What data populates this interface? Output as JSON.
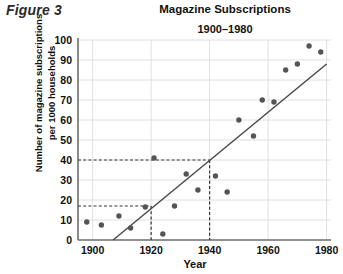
{
  "figure": {
    "label": "Figure 3"
  },
  "chart_data": {
    "type": "scatter",
    "title": "Magazine Subscriptions",
    "subtitle": "1900–1980",
    "xlabel": "Year",
    "ylabel_line1": "Number of magazine subscriptions",
    "ylabel_line2": "per 1000 households",
    "xlim": [
      1895,
      1980
    ],
    "ylim": [
      0,
      100
    ],
    "xticks": [
      1900,
      1920,
      1940,
      1960,
      1980
    ],
    "yticks": [
      0,
      10,
      20,
      30,
      40,
      50,
      60,
      70,
      80,
      90,
      100
    ],
    "grid": true,
    "legend": "none",
    "point_color": "#555555",
    "line_color": "#4a4a4a",
    "guide_color": "#333333",
    "grid_color": "#d8d8d8",
    "axis_color": "#777777",
    "x": [
      1898,
      1903,
      1909,
      1913,
      1918,
      1921,
      1924,
      1928,
      1932,
      1936,
      1942,
      1946,
      1950,
      1955,
      1958,
      1962,
      1966,
      1970,
      1974,
      1978
    ],
    "y": [
      9,
      7.5,
      12,
      6,
      16.5,
      41,
      3,
      17,
      33,
      25,
      32,
      24,
      60,
      52,
      70,
      69,
      85,
      88,
      97,
      94
    ],
    "points": [
      {
        "x": 1898,
        "y": 9
      },
      {
        "x": 1903,
        "y": 7.5
      },
      {
        "x": 1909,
        "y": 12
      },
      {
        "x": 1913,
        "y": 6
      },
      {
        "x": 1918,
        "y": 16.5
      },
      {
        "x": 1921,
        "y": 41
      },
      {
        "x": 1924,
        "y": 3
      },
      {
        "x": 1928,
        "y": 17
      },
      {
        "x": 1932,
        "y": 33
      },
      {
        "x": 1936,
        "y": 25
      },
      {
        "x": 1942,
        "y": 32
      },
      {
        "x": 1946,
        "y": 24
      },
      {
        "x": 1950,
        "y": 60
      },
      {
        "x": 1955,
        "y": 52
      },
      {
        "x": 1958,
        "y": 70
      },
      {
        "x": 1962,
        "y": 69
      },
      {
        "x": 1966,
        "y": 85
      },
      {
        "x": 1970,
        "y": 88
      },
      {
        "x": 1974,
        "y": 97
      },
      {
        "x": 1978,
        "y": 94
      }
    ],
    "trend_line": {
      "x_start": 1907,
      "y_start": 0,
      "x_end": 1980,
      "y_end": 88
    },
    "guides": [
      {
        "y": 40,
        "x": 1940
      },
      {
        "y": 17,
        "x": 1920
      }
    ]
  }
}
